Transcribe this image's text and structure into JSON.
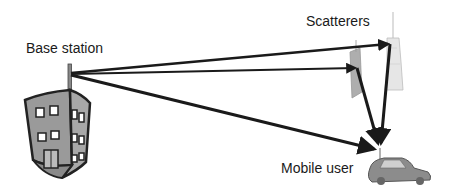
{
  "labels": {
    "base_station": "Base station",
    "scatterers": "Scatterers",
    "mobile_user": "Mobile user"
  },
  "nodes": {
    "base_station": {
      "antenna_tip": [
        70,
        73
      ],
      "icon": "building-icon"
    },
    "scatterer_1": {
      "point": [
        357,
        68
      ],
      "icon": "skyscraper-icon"
    },
    "scatterer_2": {
      "point": [
        390,
        44
      ],
      "icon": "tower-icon"
    },
    "mobile_user": {
      "antenna": [
        380,
        150
      ],
      "icon": "car-icon"
    }
  },
  "paths": [
    {
      "from": "base_station",
      "to": "scatterer_2",
      "type": "reflected"
    },
    {
      "from": "base_station",
      "to": "scatterer_1",
      "type": "reflected"
    },
    {
      "from": "base_station",
      "to": "mobile_user",
      "type": "line-of-sight"
    },
    {
      "from": "scatterer_1",
      "to": "mobile_user",
      "type": "reflected"
    },
    {
      "from": "scatterer_2",
      "to": "mobile_user",
      "type": "reflected"
    }
  ],
  "colors": {
    "line": "#1a1a1a",
    "building": "#9a9a9a",
    "outline": "#222222"
  }
}
